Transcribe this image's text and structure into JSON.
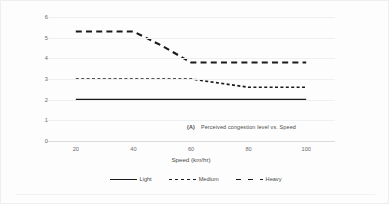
{
  "figure": {
    "caption_tag": "(A)",
    "caption_text": "Perceived congestion level vs. Speed"
  },
  "chart_data": {
    "type": "line",
    "title": "",
    "xlabel": "Speed (km/hr)",
    "ylabel": "Perceived Level of Congestion",
    "x": [
      20,
      30,
      40,
      50,
      60,
      70,
      80,
      90,
      100
    ],
    "xlim": [
      10,
      110
    ],
    "ylim": [
      0,
      6
    ],
    "xticks": [
      "20",
      "40",
      "60",
      "80",
      "100"
    ],
    "xtick_values": [
      20,
      40,
      60,
      80,
      100
    ],
    "yticks": [
      "0",
      "1",
      "2",
      "3",
      "4",
      "5",
      "6"
    ],
    "ytick_values": [
      0,
      1,
      2,
      3,
      4,
      5,
      6
    ],
    "grid": true,
    "legend_position": "bottom",
    "series": [
      {
        "name": "Light",
        "style": "solid",
        "color": "#1a1a1a",
        "values": [
          2.0,
          2.0,
          2.0,
          2.0,
          2.0,
          2.0,
          2.0,
          2.0,
          2.0
        ]
      },
      {
        "name": "Medium",
        "style": "short-dash",
        "color": "#1a1a1a",
        "values": [
          3.0,
          3.0,
          3.0,
          3.0,
          3.0,
          2.8,
          2.6,
          2.6,
          2.6
        ]
      },
      {
        "name": "Heavy",
        "style": "long-dash",
        "color": "#1a1a1a",
        "values": [
          5.3,
          5.3,
          5.3,
          4.6,
          3.8,
          3.8,
          3.8,
          3.8,
          3.8
        ]
      }
    ]
  }
}
